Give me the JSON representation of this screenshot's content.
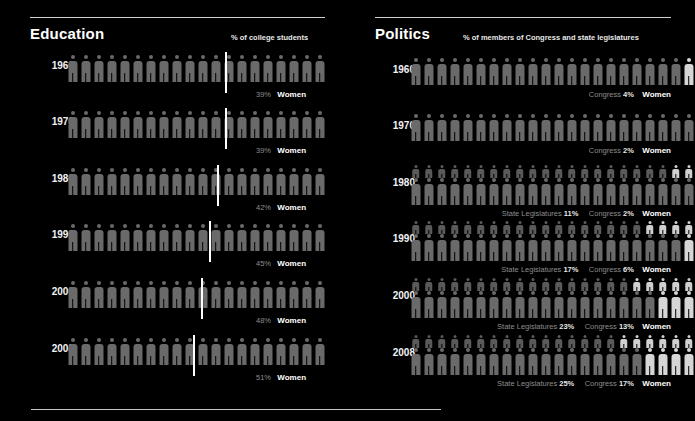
{
  "canvas": {
    "width": 683,
    "height": 421,
    "background": "#000000"
  },
  "palette": {
    "background": "#000000",
    "figure_men": "#6e6e6e",
    "figure_women": "#d6d6d6",
    "marker_line": "#ffffff",
    "rule": "#cfcfcf",
    "label_muted": "#8d8d8d",
    "label_bright": "#ffffff"
  },
  "sections": [
    {
      "id": "education",
      "title": "Education",
      "subtitle": "% of college students",
      "women_label": "Women",
      "figure_total": 20,
      "rows": [
        {
          "year": "1960",
          "women_pct": 39,
          "pct_label": "39%"
        },
        {
          "year": "1970",
          "women_pct": 39,
          "pct_label": "39%"
        },
        {
          "year": "1980",
          "women_pct": 42,
          "pct_label": "42%"
        },
        {
          "year": "1990",
          "women_pct": 45,
          "pct_label": "45%"
        },
        {
          "year": "2000",
          "women_pct": 48,
          "pct_label": "48%"
        },
        {
          "year": "2008",
          "women_pct": 51,
          "pct_label": "51%"
        }
      ]
    },
    {
      "id": "politics",
      "title": "Politics",
      "subtitle": "% of members of Congress and state legislatures",
      "women_label": "Women",
      "figure_total": 22,
      "congress_label": "Congress",
      "state_label": "State Legislatures",
      "rows": [
        {
          "year": "1960",
          "congress_pct": 4,
          "congress_label": "4%",
          "state_pct": null,
          "state_label": null
        },
        {
          "year": "1970",
          "congress_pct": 2,
          "congress_label": "2%",
          "state_pct": null,
          "state_label": null
        },
        {
          "year": "1980",
          "congress_pct": 2,
          "congress_label": "2%",
          "state_pct": 11,
          "state_label": "11%"
        },
        {
          "year": "1990",
          "congress_pct": 6,
          "congress_label": "6%",
          "state_pct": 17,
          "state_label": "17%"
        },
        {
          "year": "2000",
          "congress_pct": 13,
          "congress_label": "13%",
          "state_pct": 23,
          "state_label": "23%"
        },
        {
          "year": "2008",
          "congress_pct": 17,
          "congress_label": "17%",
          "state_pct": 25,
          "state_label": "25%"
        }
      ]
    }
  ],
  "chart_data": {
    "type": "bar",
    "subtitle": "Isotype pictogram chart: share of women",
    "xlabel": "Year",
    "ylabel": "Percent women",
    "ylim": [
      0,
      100
    ],
    "categories": [
      "1960",
      "1970",
      "1980",
      "1990",
      "2000",
      "2008"
    ],
    "series": [
      {
        "name": "% of college students",
        "values": [
          39,
          39,
          42,
          45,
          48,
          51
        ],
        "unit": "%"
      },
      {
        "name": "% of members of Congress",
        "values": [
          4,
          2,
          2,
          6,
          13,
          17
        ],
        "unit": "%"
      },
      {
        "name": "% of state legislatures",
        "values": [
          null,
          null,
          11,
          17,
          23,
          25
        ],
        "unit": "%"
      }
    ],
    "legend_position": "inline-right",
    "grid": false
  }
}
